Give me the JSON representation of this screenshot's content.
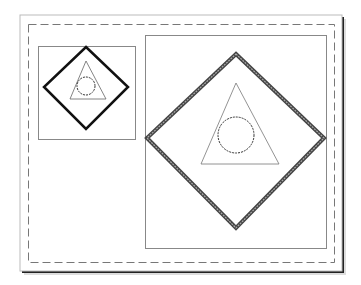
{
  "diagram": {
    "type": "layout-sheet",
    "paper": {
      "x": 20,
      "y": 15,
      "width": 322,
      "height": 256,
      "shadow": "#222222"
    },
    "margin_border": {
      "x": 28,
      "y": 24,
      "width": 306,
      "height": 238,
      "style": "dashed",
      "color": "#777777"
    },
    "viewports": [
      {
        "id": "small",
        "box": {
          "x": 38,
          "y": 46,
          "width": 97,
          "height": 93
        },
        "diamond": {
          "points": [
            [
              86,
              47
            ],
            [
              128,
              87
            ],
            [
              86,
              129
            ],
            [
              44,
              87
            ]
          ],
          "stroke": "#111111",
          "width": 2.5
        },
        "triangle": {
          "points": [
            [
              86,
              61
            ],
            [
              106,
              99
            ],
            [
              70,
              99
            ]
          ],
          "stroke": "#666666"
        },
        "circle": {
          "cx": 86,
          "cy": 86,
          "r": 9,
          "stroke": "#333333",
          "style": "dashed"
        }
      },
      {
        "id": "large",
        "box": {
          "x": 145,
          "y": 35,
          "width": 181,
          "height": 213
        },
        "diamond": {
          "points": [
            [
              236,
              54
            ],
            [
              324,
              138
            ],
            [
              236,
              228
            ],
            [
              147,
              138
            ]
          ],
          "stroke": "#666666",
          "width": 4
        },
        "triangle": {
          "points": [
            [
              236,
              83
            ],
            [
              279,
              164
            ],
            [
              201,
              164
            ]
          ],
          "stroke": "#777777"
        },
        "circle": {
          "cx": 236,
          "cy": 135,
          "r": 18,
          "stroke": "#333333",
          "style": "dashed"
        }
      }
    ]
  }
}
